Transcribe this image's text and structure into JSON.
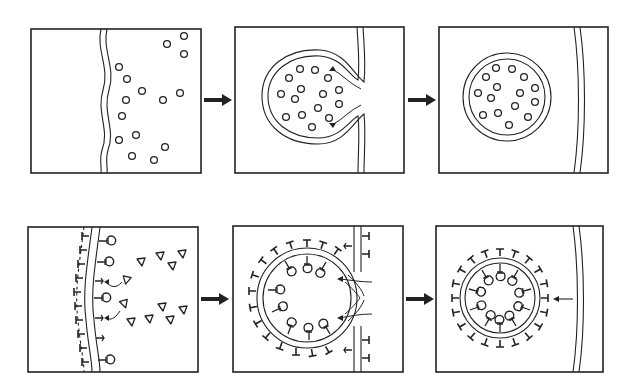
{
  "diagram": {
    "title": "",
    "rows": [
      {
        "name": "bulk-phase-endocytosis",
        "panels": [
          {
            "id": "top-1",
            "label": "",
            "contents": "wavy double membrane with free particles (circles) outside"
          },
          {
            "id": "top-2",
            "label": "",
            "contents": "membrane invaginates, enclosing particles; pinching arrows at neck"
          },
          {
            "id": "top-3",
            "label": "",
            "contents": "closed vesicle containing particles; membrane resealed"
          }
        ],
        "connectors": [
          "arrow-right",
          "arrow-right"
        ]
      },
      {
        "name": "receptor-mediated-endocytosis",
        "panels": [
          {
            "id": "bottom-1",
            "label": "",
            "contents": "coated membrane with receptors; ligands (triangles) binding, curved arrows"
          },
          {
            "id": "bottom-2",
            "label": "",
            "contents": "coated pit invaginates with ligand-bound receptors; neck pinching arrows"
          },
          {
            "id": "bottom-3",
            "label": "",
            "contents": "coated vesicle with bound ligands; arrow pointing from membrane toward vesicle"
          }
        ],
        "connectors": [
          "arrow-right",
          "arrow-right"
        ]
      }
    ],
    "colors": {
      "line": "#222222",
      "background": "#ffffff"
    }
  }
}
